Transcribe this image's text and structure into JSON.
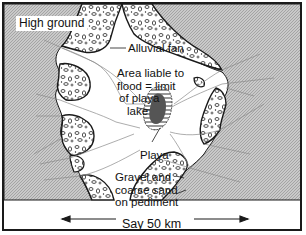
{
  "diagram": {
    "type": "geomorphology-cross-section-plan",
    "labels": {
      "high_ground": "High ground",
      "alluvial_fan": "Alluvial fan",
      "flood_area_line1": "Area liable to",
      "flood_area_line2": "flood = limit",
      "flood_area_line3": "of playa",
      "flood_area_line4": "lake",
      "playa": "Playa",
      "gravel_line1": "Gravel and",
      "gravel_line2": "coarse sand",
      "gravel_line3": "on pediment"
    },
    "scale": {
      "label": "Say 50 km"
    },
    "colors": {
      "high_ground_fill": "#bdbdbd",
      "fan_fill": "#ffffff",
      "playa_fill": "#555555",
      "outline": "#1a1a1a",
      "drainage_lines": "#888888"
    }
  }
}
